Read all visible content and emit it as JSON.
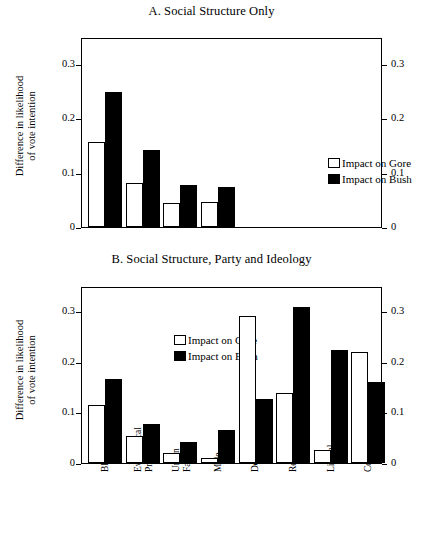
{
  "figure": {
    "ylabel_line1": "Difference  in likelihood",
    "ylabel_line2": "of vote intention"
  },
  "legend": {
    "gore": "Impact on Gore",
    "bush": "Impact on Bush"
  },
  "panel_a": {
    "title": "A. Social Structure Only",
    "ticks": [
      "0.3",
      "0.2",
      "0.1",
      "0"
    ]
  },
  "panel_b": {
    "title": "B. Social Structure, Party and Ideology",
    "ticks": [
      "0.3",
      "0.2",
      "0.1",
      "0"
    ]
  },
  "chart_data": [
    {
      "type": "bar",
      "title": "A. Social Structure Only",
      "xlabel": "",
      "ylabel": "Difference  in likelihood of vote intention",
      "ylim": [
        0,
        0.35
      ],
      "yticks": [
        0,
        0.1,
        0.2,
        0.3
      ],
      "grid": false,
      "legend_position": "inside-right",
      "categories": [
        "Black",
        "Evangelical Protestant",
        "Union Family",
        "Male"
      ],
      "category_slots": 8,
      "series": [
        {
          "name": "Impact on Gore",
          "color": "#ffffff",
          "values": [
            0.156,
            0.082,
            0.045,
            0.046
          ]
        },
        {
          "name": "Impact on Bush",
          "color": "#000000",
          "values": [
            0.248,
            0.141,
            0.077,
            0.074
          ]
        }
      ]
    },
    {
      "type": "bar",
      "title": "B. Social Structure, Party and Ideology",
      "xlabel": "",
      "ylabel": "Difference in likelihood of vote intention",
      "ylim": [
        0,
        0.35
      ],
      "yticks": [
        0,
        0.1,
        0.2,
        0.3
      ],
      "grid": false,
      "legend_position": "inside-left",
      "categories": [
        "Black",
        "Evangelical Protestant",
        "Union Family",
        "Male",
        "Democrat",
        "Republican",
        "Liberal",
        "Conservative"
      ],
      "category_labels_multiline": [
        [
          "Black"
        ],
        [
          "Evangelical",
          "Protestant"
        ],
        [
          "Union",
          "Family"
        ],
        [
          "Male"
        ],
        [
          "Democrat"
        ],
        [
          "Republican"
        ],
        [
          "Liberal"
        ],
        [
          "Conservative"
        ]
      ],
      "series": [
        {
          "name": "Impact on Gore",
          "color": "#ffffff",
          "values": [
            0.115,
            0.053,
            0.02,
            0.009,
            0.29,
            0.139,
            0.025,
            0.219
          ]
        },
        {
          "name": "Impact on Bush",
          "color": "#000000",
          "values": [
            0.166,
            0.078,
            0.042,
            0.066,
            0.127,
            0.308,
            0.224,
            0.161
          ]
        }
      ]
    }
  ]
}
